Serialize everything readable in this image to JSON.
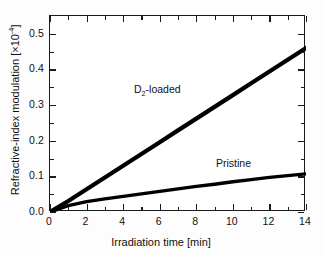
{
  "chart_data": {
    "type": "line",
    "title": "",
    "xlabel": "Irradiation time [min]",
    "ylabel": "Refractive-index modulation [×10⁻⁴]",
    "ylabel_text": "Refractive-index modulation [×10",
    "ylabel_exp": "-4",
    "ylabel_tail": "]",
    "xlim": [
      0,
      14
    ],
    "ylim": [
      0.0,
      0.55
    ],
    "grid": false,
    "legend": "inline-annotations",
    "xticks": [
      0,
      2,
      4,
      6,
      8,
      10,
      12,
      14
    ],
    "xticklabels": [
      "0",
      "2",
      "4",
      "6",
      "8",
      "10",
      "12",
      "14"
    ],
    "xminorticks": [
      1,
      3,
      5,
      7,
      9,
      11,
      13
    ],
    "yticks": [
      0.0,
      0.1,
      0.2,
      0.3,
      0.4,
      0.5
    ],
    "yticklabels": [
      "0.0",
      "0.1",
      "0.2",
      "0.3",
      "0.4",
      "0.5"
    ],
    "yminorticks": [
      0.05,
      0.15,
      0.25,
      0.35,
      0.45
    ],
    "line_color": "#000000",
    "frame_color": "#1a1a1a",
    "series": [
      {
        "name": "D2-loaded",
        "label_text": "D",
        "label_sub": "2",
        "label_tail": "-loaded",
        "x": [
          0,
          1,
          2,
          3,
          4,
          5,
          6,
          7,
          8,
          9,
          10,
          11,
          12,
          13,
          14
        ],
        "values": [
          0.0,
          0.031,
          0.064,
          0.097,
          0.13,
          0.163,
          0.196,
          0.229,
          0.262,
          0.295,
          0.328,
          0.361,
          0.394,
          0.427,
          0.46
        ],
        "line_width": 4.2,
        "color": "#000000"
      },
      {
        "name": "Pristine",
        "label_text": "Pristine",
        "x": [
          0,
          1,
          2,
          3,
          4,
          5,
          6,
          7,
          8,
          9,
          10,
          11,
          12,
          13,
          14
        ],
        "values": [
          0.0,
          0.018,
          0.029,
          0.037,
          0.044,
          0.051,
          0.058,
          0.065,
          0.072,
          0.078,
          0.085,
          0.091,
          0.097,
          0.102,
          0.107
        ],
        "line_width": 3.4,
        "color": "#000000"
      }
    ]
  }
}
